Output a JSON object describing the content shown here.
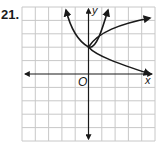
{
  "problem": {
    "number": "21."
  },
  "graph": {
    "axis_labels": {
      "x": "x",
      "y": "y",
      "origin": "O"
    },
    "grid": {
      "cols": 10,
      "rows": 10,
      "x_range": [
        -5,
        5
      ],
      "y_range": [
        -5,
        5
      ],
      "line_color": "#c8c8c8"
    },
    "curve_color": "#1a1a1a",
    "curves": [
      {
        "name": "parabola",
        "description": "upward-opening curve through (0,2), arrows at upper-left and upper-right"
      },
      {
        "name": "sideways-parabola",
        "description": "right-opening curve through (0,2), arrows at upper-right and lower-right"
      }
    ]
  }
}
